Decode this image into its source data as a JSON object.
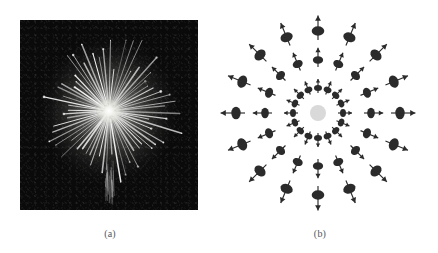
{
  "figure": {
    "panels": [
      {
        "id": "a",
        "caption": "(a)",
        "kind": "photograph",
        "subject": "firework burst",
        "background_color": "#0a0a0a",
        "streak_color": "#ffffff",
        "center": [
          110,
          110
        ],
        "frame": [
          20,
          20,
          178,
          190
        ]
      },
      {
        "id": "b",
        "caption": "(b)",
        "kind": "radial-spin-diagram",
        "background_color": "#ffffff",
        "particle_color": "#2b2b2b",
        "center_disc_color": "#d9d9d9",
        "center": [
          99,
          113
        ],
        "center_disc_radius": 8,
        "ray_count": 16,
        "ray_angle_step_deg": 22.5,
        "ring_radii": [
          25,
          53,
          82
        ],
        "arrow_direction": "outward-radial"
      }
    ]
  },
  "chart_data": {
    "type": "scatter",
    "title": "",
    "xlabel": "",
    "ylabel": "",
    "legend": [],
    "grid": false,
    "panel_a": {
      "type": "image",
      "description": "firework burst photograph, radial streaks from bright core",
      "streak_count": 64,
      "core_brightness": 1.0
    },
    "panel_b": {
      "type": "scatter",
      "description": "16 radial rays, 3 particles per ray, outward arrows, gray core disc",
      "rays_deg": [
        0,
        22.5,
        45,
        67.5,
        90,
        112.5,
        135,
        157.5,
        180,
        202.5,
        225,
        247.5,
        270,
        292.5,
        315,
        337.5
      ],
      "radii": [
        25,
        53,
        82
      ],
      "point_count": 48,
      "center_disc_radius": 8
    }
  }
}
